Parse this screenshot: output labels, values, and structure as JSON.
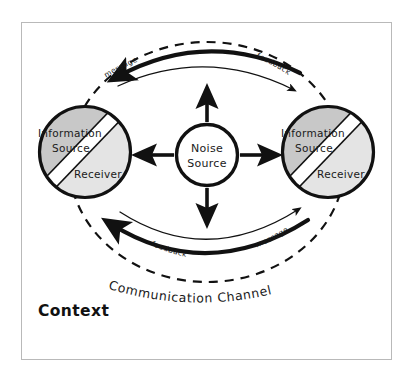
{
  "diagram": {
    "frame": {
      "border_color": "#b9b9b9",
      "background": "#ffffff"
    },
    "colors": {
      "stroke": "#111111",
      "source_fill": "#c8c8c8",
      "receiver_fill": "#e4e4e4",
      "noise_fill": "#ffffff",
      "frame_border": "#b9b9b9",
      "text": "#1a1a1a"
    },
    "nodes": [
      {
        "id": "left-party",
        "cx": 85,
        "cy": 152,
        "r": 46,
        "upper_label": "Information",
        "upper_label_2": "Source",
        "lower_label": "Receiver"
      },
      {
        "id": "right-party",
        "cx": 328,
        "cy": 152,
        "r": 46,
        "upper_label": "Information",
        "upper_label_2": "Source",
        "lower_label": "Receiver"
      }
    ],
    "noise": {
      "id": "noise-source",
      "cx": 207,
      "cy": 155,
      "r": 31,
      "label_line_1": "Noise",
      "label_line_2": "Source",
      "arrow_directions": [
        "up",
        "right",
        "down",
        "left"
      ]
    },
    "arcs": [
      {
        "id": "top-message",
        "label": "message",
        "weight": "thick",
        "direction": "right-to-left",
        "position": "top"
      },
      {
        "id": "top-feedback",
        "label": "feedback",
        "weight": "thin",
        "direction": "left-to-right",
        "position": "top"
      },
      {
        "id": "bottom-feedback",
        "label": "feedback",
        "weight": "thick",
        "direction": "right-to-left",
        "position": "bottom"
      },
      {
        "id": "bottom-message",
        "label": "message",
        "weight": "thin",
        "direction": "left-to-right",
        "position": "bottom"
      }
    ],
    "channel": {
      "label": "Communication Channel",
      "style": "dashed-ellipse"
    },
    "context": {
      "label": "Context"
    }
  }
}
